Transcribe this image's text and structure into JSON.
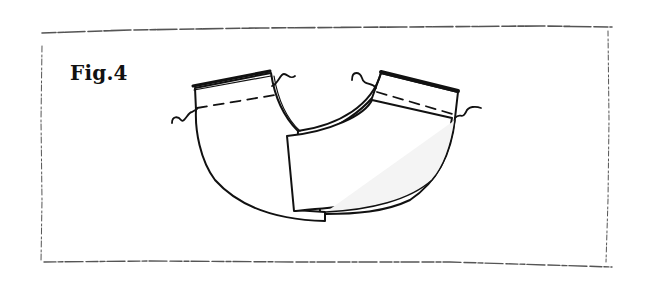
{
  "figure": {
    "label": "Fig.4",
    "colors": {
      "ink": "#111111",
      "frame": "#555555",
      "background": "#ffffff",
      "fill_light": "#f4f4f4"
    },
    "elements": {
      "frame": "sketch-border",
      "left_panel": {
        "has_dashed_seam": true,
        "has_wavy_marks": 2
      },
      "right_panel": {
        "has_dashed_seam": true,
        "has_wavy_marks": 2
      },
      "front_panel": "rectangular overlap piece"
    }
  }
}
